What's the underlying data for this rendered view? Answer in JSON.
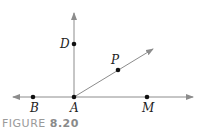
{
  "figure": {
    "caption_prefix": "FIGURE",
    "caption_number": "8.20",
    "line_color": "#8c8c8c",
    "point_color": "#111111"
  },
  "points": {
    "A": {
      "label": "A",
      "x": 74,
      "y": 97
    },
    "B": {
      "label": "B",
      "x": 33,
      "y": 97
    },
    "M": {
      "label": "M",
      "x": 147,
      "y": 97
    },
    "D": {
      "label": "D",
      "x": 74,
      "y": 44
    },
    "P": {
      "label": "P",
      "x": 118,
      "y": 70
    }
  },
  "lines": [
    {
      "name": "line-BM",
      "type": "line",
      "through": [
        "B",
        "A",
        "M"
      ]
    },
    {
      "name": "ray-AD",
      "type": "ray",
      "from": "A",
      "through": "D"
    },
    {
      "name": "ray-AP",
      "type": "ray",
      "from": "A",
      "through": "P"
    }
  ]
}
